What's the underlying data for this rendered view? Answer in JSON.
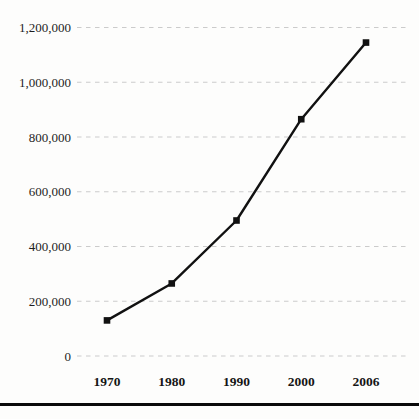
{
  "chart_data": {
    "type": "line",
    "title": "",
    "xlabel": "",
    "ylabel": "",
    "categories": [
      "1970",
      "1980",
      "1990",
      "2000",
      "2006"
    ],
    "series": [
      {
        "name": "series-1",
        "values": [
          130000,
          265000,
          495000,
          865000,
          1145000
        ]
      }
    ],
    "ylim": [
      0,
      1200000
    ],
    "y_ticks": [
      0,
      200000,
      400000,
      600000,
      800000,
      1000000,
      1200000
    ],
    "y_tick_labels": [
      "0",
      "200,000",
      "400,000",
      "600,000",
      "800,000",
      "1,000,000",
      "1,200,000"
    ],
    "grid": "horizontal-dashed",
    "legend": false,
    "marker": "square",
    "colors": {
      "line": "#111111",
      "marker": "#111111",
      "gridline": "#cbcbcb",
      "tick_text": "#1e1e1e",
      "bottom_rule": "#0a0a0a",
      "background": "#fdfdfc"
    }
  }
}
